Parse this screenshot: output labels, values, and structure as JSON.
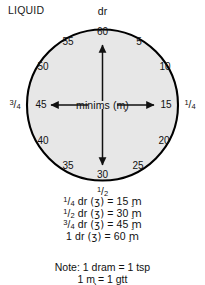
{
  "heading": "LIQUID",
  "dial": {
    "unit_top_label": "dr",
    "center_label": "minims (m̧)",
    "fill_color": "#e7e7e7",
    "stroke_color": "#000000",
    "ticks": [
      {
        "value": "60",
        "angle_deg": 0
      },
      {
        "value": "5",
        "angle_deg": 30
      },
      {
        "value": "10",
        "angle_deg": 60
      },
      {
        "value": "15",
        "angle_deg": 90
      },
      {
        "value": "20",
        "angle_deg": 120
      },
      {
        "value": "25",
        "angle_deg": 150
      },
      {
        "value": "30",
        "angle_deg": 180
      },
      {
        "value": "35",
        "angle_deg": 210
      },
      {
        "value": "40",
        "angle_deg": 240
      },
      {
        "value": "45",
        "angle_deg": 270
      },
      {
        "value": "50",
        "angle_deg": 300
      },
      {
        "value": "55",
        "angle_deg": 330
      }
    ],
    "fractions": {
      "right": {
        "num": "1",
        "den": "4"
      },
      "bottom": {
        "num": "1",
        "den": "2"
      },
      "left": {
        "num": "3",
        "den": "4"
      }
    }
  },
  "equations": [
    {
      "num": "1",
      "den": "4",
      "unit": "dr",
      "symbol": "(ʒ)",
      "eq": "=",
      "amount": "15",
      "result_unit": "m̧"
    },
    {
      "num": "1",
      "den": "2",
      "unit": "dr",
      "symbol": "(ʒ)",
      "eq": "=",
      "amount": "30",
      "result_unit": "m̧"
    },
    {
      "num": "3",
      "den": "4",
      "unit": "dr",
      "symbol": "(ʒ)",
      "eq": "=",
      "amount": "45",
      "result_unit": "m̧"
    },
    {
      "whole": "1",
      "unit": "dr",
      "symbol": "(ʒ)",
      "eq": "=",
      "amount": "60",
      "result_unit": "m̧"
    }
  ],
  "notes": [
    "Note: 1 dram = 1 tsp",
    "1 m̧ = 1 gtt"
  ]
}
